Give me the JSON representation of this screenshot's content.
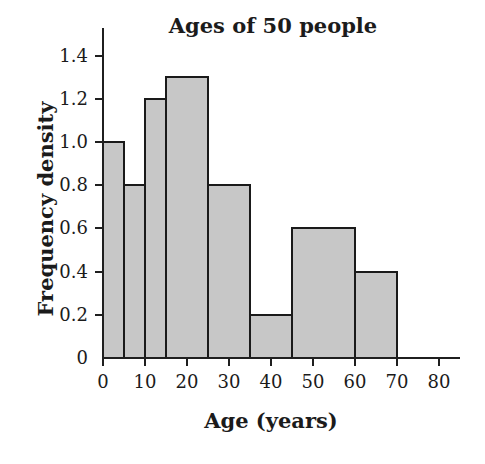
{
  "chart_data": {
    "type": "bar",
    "subtype": "histogram",
    "title": "Ages of 50 people",
    "xlabel": "Age (years)",
    "ylabel": "Frequency density",
    "bins": [
      {
        "from": 0,
        "to": 5,
        "density": 1.0
      },
      {
        "from": 5,
        "to": 10,
        "density": 0.8
      },
      {
        "from": 10,
        "to": 15,
        "density": 1.2
      },
      {
        "from": 15,
        "to": 25,
        "density": 1.3
      },
      {
        "from": 25,
        "to": 35,
        "density": 0.8
      },
      {
        "from": 35,
        "to": 45,
        "density": 0.2
      },
      {
        "from": 45,
        "to": 60,
        "density": 0.6
      },
      {
        "from": 60,
        "to": 70,
        "density": 0.4
      }
    ],
    "x_ticks": [
      {
        "v": 0,
        "label": "0"
      },
      {
        "v": 10,
        "label": "10"
      },
      {
        "v": 20,
        "label": "20"
      },
      {
        "v": 30,
        "label": "30"
      },
      {
        "v": 40,
        "label": "40"
      },
      {
        "v": 50,
        "label": "50"
      },
      {
        "v": 60,
        "label": "60"
      },
      {
        "v": 70,
        "label": "70"
      },
      {
        "v": 80,
        "label": "80"
      }
    ],
    "y_ticks": [
      {
        "v": 0,
        "label": "0"
      },
      {
        "v": 0.2,
        "label": "0.2"
      },
      {
        "v": 0.4,
        "label": "0.4"
      },
      {
        "v": 0.6,
        "label": "0.6"
      },
      {
        "v": 0.8,
        "label": "0.8"
      },
      {
        "v": 1.0,
        "label": "1.0"
      },
      {
        "v": 1.2,
        "label": "1.2"
      },
      {
        "v": 1.4,
        "label": "1.4"
      }
    ],
    "xlim": [
      0,
      84
    ],
    "ylim": [
      0,
      1.55
    ],
    "grid": false,
    "legend": "none",
    "colors": {
      "bar_fill": "#c7c7c7",
      "bar_border": "#1a1a1a",
      "axis": "#1f1f1f",
      "text": "#1b1b1b",
      "background": "#ffffff"
    }
  }
}
